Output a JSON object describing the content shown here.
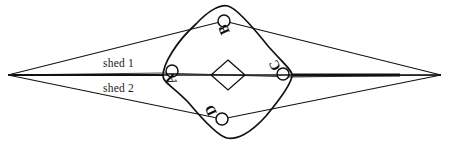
{
  "figure": {
    "type": "line-diagram",
    "background_color": "#ffffff",
    "stroke_color": "#111111",
    "width": 450,
    "height": 144
  },
  "labels": {
    "shed1": "shed 1",
    "shed2": "shed 2",
    "point_a": "A",
    "point_b": "B",
    "point_c": "C",
    "point_d": "D"
  },
  "geometry": {
    "left_apex": {
      "x": 8,
      "y": 75
    },
    "right_apex": {
      "x": 441,
      "y": 75
    },
    "center_axis_y": 75,
    "rounded_diamond": {
      "left": {
        "x": 163,
        "y": 76
      },
      "top": {
        "x": 228,
        "y": 6
      },
      "right": {
        "x": 292,
        "y": 75
      },
      "bottom": {
        "x": 227,
        "y": 138
      }
    },
    "center_small_diamond": {
      "cx": 228,
      "cy": 75,
      "half_w": 17,
      "half_h": 15
    },
    "markers": [
      {
        "id": "A",
        "cx": 172,
        "cy": 71,
        "r": 6
      },
      {
        "id": "B",
        "cx": 224,
        "cy": 21,
        "r": 6
      },
      {
        "id": "C",
        "cx": 283,
        "cy": 74,
        "r": 6
      },
      {
        "id": "D",
        "cx": 222,
        "cy": 119,
        "r": 6
      }
    ],
    "shed1_upper_path": "left apex to B marker, B to right apex",
    "shed2_lower_path": "left apex to D marker, D to right apex"
  }
}
